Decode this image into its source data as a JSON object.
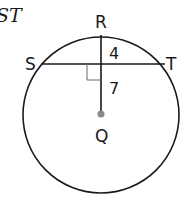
{
  "fragment_text": "ST",
  "diagram": {
    "type": "circle-chord",
    "center_label": "Q",
    "top_point_label": "R",
    "chord_left_label": "S",
    "chord_right_label": "T",
    "segment_upper_length": "4",
    "segment_lower_length": "7",
    "right_angle_marker": true,
    "colors": {
      "stroke": "#1a1a1a",
      "center_dot": "#888888"
    }
  }
}
